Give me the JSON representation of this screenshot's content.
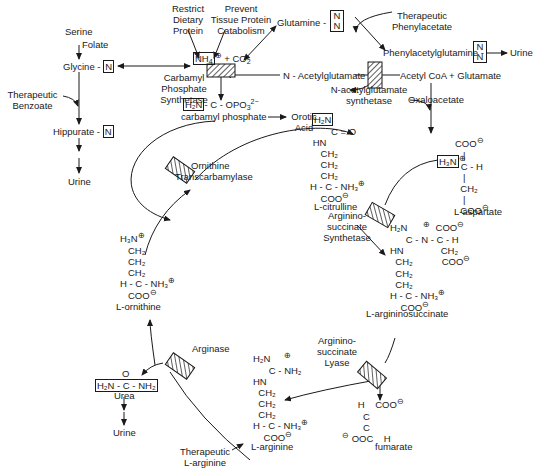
{
  "left_pathway": {
    "serine": "Serine",
    "folate": "Folate",
    "glycine": "Glycine",
    "glycine_n": "N",
    "therapeutic_benzoate_1": "Therapeutic",
    "therapeutic_benzoate_2": "Benzoate",
    "hippurate": "Hippurate",
    "hippurate_n": "N",
    "urine": "Urine"
  },
  "top_inputs": {
    "restrict_1": "Restrict",
    "restrict_2": "Dietary",
    "restrict_3": "Protein",
    "prevent_1": "Prevent",
    "prevent_2": "Tissue Protein",
    "prevent_3": "Catabolism",
    "nh4": "NH",
    "nh4_sub": "4",
    "co2": "+ CO",
    "co2_sub": "2",
    "glutamine": "Glutamine",
    "glutamine_n1": "N",
    "glutamine_n2": "N"
  },
  "cps": {
    "label_1": "Carbamyl",
    "label_2": "Phosphate",
    "label_3": "Synthetase",
    "activator": "N - Acetylglutamate"
  },
  "carbamyl_phosphate": {
    "h2n": "H₂N",
    "formula": "- C - OPO",
    "formula_sub": "3",
    "formula_sup": "2−",
    "name": "carbamyl phosphate",
    "orotic_1": "Orotic",
    "orotic_2": "Acid"
  },
  "nags": {
    "label_1": "N-acetylglutamate",
    "label_2": "synthetase",
    "substrates": "Acetyl CoA  +  Glutamate",
    "oxaloacetate": "Oxaloacetate"
  },
  "phenylacetate": {
    "therapeutic_1": "Therapeutic",
    "therapeutic_2": "Phenylacetate",
    "product": "Phenylacetylglutamine -",
    "n1": "N",
    "n2": "N",
    "urine": "Urine"
  },
  "aspartate": {
    "name": "L-aspartate",
    "h3n": "H₃N"
  },
  "citrulline": {
    "name": "L-citrulline",
    "h2n": "H₂N"
  },
  "enzymes": {
    "otc_1": "Ornithine",
    "otc_2": "Transcarbamylase",
    "ass_1": "Arginino-",
    "ass_2": "succinate",
    "ass_3": "Synthetase",
    "asl_1": "Arginino-",
    "asl_2": "succinate",
    "asl_3": "Lyase",
    "arginase": "Arginase"
  },
  "intermediates": {
    "argininosuccinate": "L-argininosuccinate",
    "ornithine": "L-ornithine",
    "arginine": "L-arginine",
    "fumarate": "fumarate",
    "urea": "Urea",
    "urea_formula": "H₂N - C - NH₂",
    "urea_urine": "Urine",
    "therapeutic_arginine_1": "Therapeutic",
    "therapeutic_arginine_2": "L-arginine"
  },
  "colors": {
    "ink": "#1a1a1a",
    "background": "#ffffff"
  }
}
